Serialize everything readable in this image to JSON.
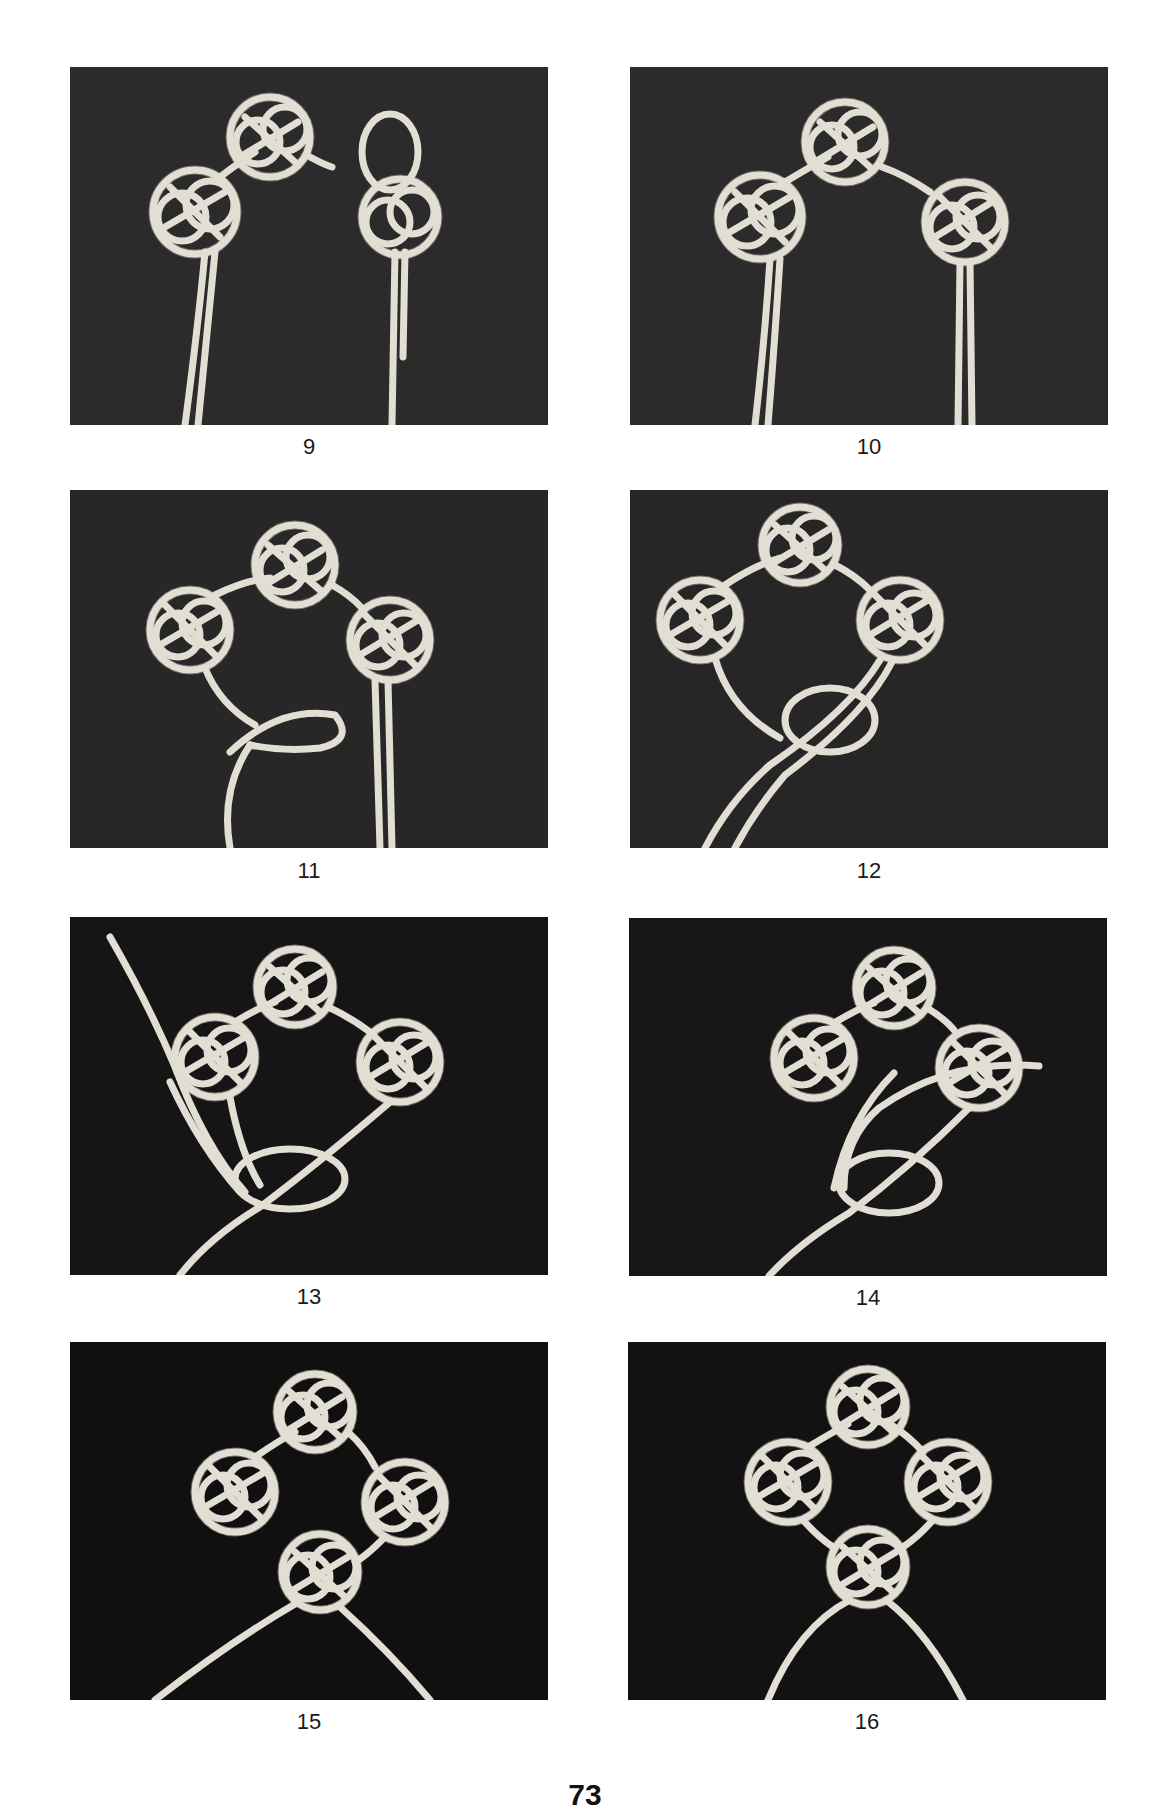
{
  "page": {
    "number": "73",
    "background": "#ffffff",
    "caption_color": "#1a1a1a"
  },
  "figures": [
    {
      "id": "9",
      "caption": "9",
      "background": "#2b2b2b",
      "knots_complete": 2,
      "description": "two knots joined, third knot loop started at right"
    },
    {
      "id": "10",
      "caption": "10",
      "background": "#2b2b2b",
      "knots_complete": 3,
      "description": "three knots joined in an arch"
    },
    {
      "id": "11",
      "caption": "11",
      "background": "#272727",
      "knots_complete": 3,
      "description": "three knots with loop formed at lower left"
    },
    {
      "id": "12",
      "caption": "12",
      "background": "#262626",
      "knots_complete": 3,
      "description": "fourth knot loops being crossed at bottom"
    },
    {
      "id": "13",
      "caption": "13",
      "background": "#151515",
      "knots_complete": 3,
      "description": "cord ends threaded through bottom loops"
    },
    {
      "id": "14",
      "caption": "14",
      "background": "#171717",
      "knots_complete": 3,
      "description": "cord end weaving through bottom knot"
    },
    {
      "id": "15",
      "caption": "15",
      "background": "#101010",
      "knots_complete": 4,
      "description": "four knots in a ring, cord ends spread"
    },
    {
      "id": "16",
      "caption": "16",
      "background": "#121212",
      "knots_complete": 4,
      "description": "finished ring of four knots with ends hanging down"
    }
  ],
  "colors": {
    "cord": "#e2ded4",
    "cord_shadow": "#6f6b64"
  }
}
